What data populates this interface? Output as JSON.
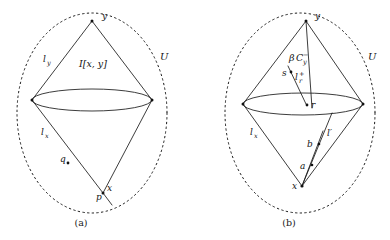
{
  "figure": {
    "background_color": "#ffffff",
    "ink_color": "#1a1a1a",
    "width": 390,
    "height": 240
  },
  "panels": [
    {
      "id": "panel-a",
      "caption": "(a)",
      "boundary_label": "U",
      "labels": {
        "apex_top": "y",
        "apex_bottom": "x",
        "left_upper_edge": "l_y",
        "left_lower_edge": "l_x",
        "interior_region": "I[x, y]",
        "point_q": "q",
        "point_p": "p"
      },
      "label_text": {
        "l_y_base": "l",
        "l_y_sub": "y",
        "l_x_base": "l",
        "l_x_sub": "x",
        "interior": "I[x, y]",
        "U": "U",
        "y": "y",
        "x": "x",
        "q": "q",
        "p": "p"
      }
    },
    {
      "id": "panel-b",
      "caption": "(b)",
      "boundary_label": "U",
      "labels": {
        "apex_top": "y",
        "apex_bottom": "x",
        "left_lower_edge": "l_x",
        "cone_label": "βC_y^-",
        "ray_label": "l_r^+",
        "point_s": "s",
        "point_r": "r",
        "point_a": "a",
        "point_b": "b",
        "segment_label": "l′"
      },
      "label_text": {
        "beta": "β",
        "C": "C",
        "C_sub": "y",
        "C_sup": "−",
        "l_r_base": "l",
        "l_r_sub": "r",
        "l_r_sup": "+",
        "l_x_base": "l",
        "l_x_sub": "x",
        "l_prime": "l′",
        "U": "U",
        "y": "y",
        "x": "x",
        "s": "s",
        "r": "r",
        "a": "a",
        "b": "b"
      }
    }
  ]
}
